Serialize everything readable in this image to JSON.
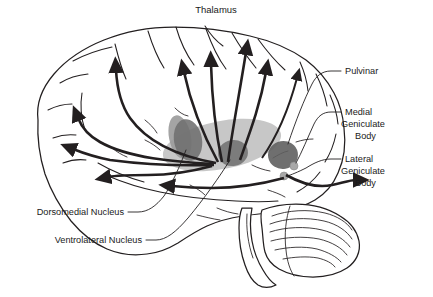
{
  "figure": {
    "title": "Thalamus",
    "type": "anatomical-diagram",
    "background_color": "#ffffff",
    "ink_color": "#231f20"
  },
  "labels": {
    "title": "Thalamus",
    "pulvinar": "Pulvinar",
    "medial_geniculate_line1": "Medial",
    "medial_geniculate_line2": "Geniculate",
    "medial_geniculate_line3": "Body",
    "lateral_geniculate_line1": "Lateral",
    "lateral_geniculate_line2": "Geniculate",
    "lateral_geniculate_line3": "Body",
    "dorsomedial_nucleus": "Dorsomedial Nucleus",
    "ventrolateral_nucleus": "Ventrolateral Nucleus"
  },
  "structures": [
    {
      "name": "thalamus-body",
      "label": "Thalamus",
      "fill": "#bdbdbd",
      "shape": "ellipse"
    },
    {
      "name": "dorsomedial-nucleus",
      "label": "Dorsomedial Nucleus",
      "fill": "#808080",
      "shape": "ellipse"
    },
    {
      "name": "ventrolateral-nucleus",
      "label": "Ventrolateral Nucleus",
      "fill": "#808080",
      "shape": "ellipse"
    },
    {
      "name": "pulvinar",
      "label": "Pulvinar",
      "fill": "#707070",
      "shape": "ellipse"
    },
    {
      "name": "medial-geniculate-body",
      "label": "Medial Geniculate Body",
      "fill": "#a8a8a8",
      "shape": "small-ellipse"
    },
    {
      "name": "lateral-geniculate-body",
      "label": "Lateral Geniculate Body",
      "fill": "#a8a8a8",
      "shape": "small-ellipse"
    }
  ],
  "colors": {
    "thalamus_body": "#bdbdbd",
    "nucleus_dark": "#808080",
    "pulvinar": "#707070",
    "geniculate": "#a8a8a8",
    "ink": "#231f20",
    "page": "#ffffff"
  },
  "projection_count": 11
}
